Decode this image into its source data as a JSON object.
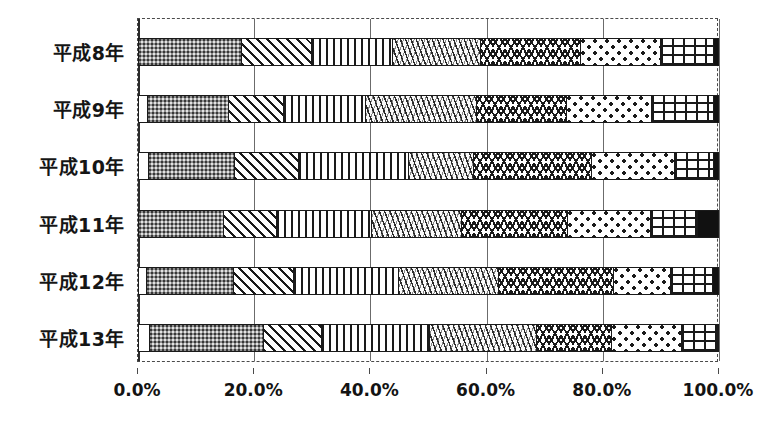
{
  "chart_data": {
    "type": "bar",
    "orientation": "horizontal",
    "stacked": true,
    "normalized": "100%",
    "title": "",
    "subtitle": "",
    "xlabel": "",
    "ylabel": "",
    "xlim": [
      0,
      100
    ],
    "grid": true,
    "grid_axis": "x",
    "legend": "none",
    "legend_position": "none",
    "categories": [
      "平成8年",
      "平成9年",
      "平成10年",
      "平成11年",
      "平成12年",
      "平成13年"
    ],
    "xticks": [
      "0.0%",
      "20.0%",
      "40.0%",
      "60.0%",
      "80.0%",
      "100.0%"
    ],
    "xtick_values": [
      0,
      20,
      40,
      60,
      80,
      100
    ],
    "series": [
      {
        "name": "series-1",
        "pattern": "white-blank",
        "values": [
          0.0,
          1.5,
          1.7,
          0.0,
          1.4,
          1.9
        ]
      },
      {
        "name": "series-2",
        "pattern": "gray-dotted",
        "values": [
          17.7,
          14.0,
          14.9,
          14.6,
          15.0,
          19.6
        ]
      },
      {
        "name": "series-3",
        "pattern": "diagonal-hatch",
        "values": [
          12.0,
          9.5,
          11.0,
          9.1,
          10.2,
          10.0
        ]
      },
      {
        "name": "series-4",
        "pattern": "vertical-hatch",
        "values": [
          14.1,
          14.1,
          18.8,
          16.4,
          18.2,
          18.6
        ]
      },
      {
        "name": "series-5",
        "pattern": "fine-zigzag",
        "values": [
          15.1,
          19.1,
          11.2,
          15.5,
          17.2,
          18.4
        ]
      },
      {
        "name": "series-6",
        "pattern": "wave-hatch",
        "values": [
          17.2,
          15.5,
          20.3,
          18.2,
          19.8,
          12.9
        ]
      },
      {
        "name": "series-7",
        "pattern": "chevron-dots",
        "values": [
          13.8,
          14.6,
          14.3,
          14.3,
          9.8,
          12.0
        ]
      },
      {
        "name": "series-8",
        "pattern": "cross-grid",
        "values": [
          9.0,
          10.7,
          6.8,
          8.2,
          7.2,
          6.2
        ]
      },
      {
        "name": "series-9",
        "pattern": "solid-black",
        "values": [
          1.1,
          1.0,
          1.0,
          3.7,
          1.2,
          0.4
        ]
      }
    ]
  },
  "axis": {
    "x_min_label": "0.0%",
    "x_max_label": "100.0%"
  }
}
